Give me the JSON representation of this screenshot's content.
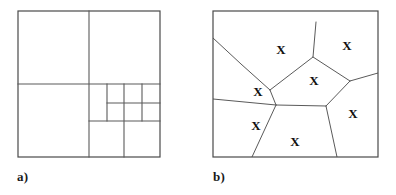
{
  "figure": {
    "background_color": "#ffffff",
    "line_color": "#5a5a5a",
    "border_color": "#4a4a4a",
    "marker_color": "#111111",
    "width": 396,
    "height": 195
  },
  "panels": [
    {
      "id": "a",
      "caption": "a)",
      "type": "quadtree",
      "frame": {
        "x": 18,
        "y": 11,
        "w": 142,
        "h": 146
      },
      "description": "Adaptive quadtree subdivision of a square region",
      "split_lines": [
        {
          "name": "root-vertical-split",
          "x1": 89,
          "y1": 11,
          "x2": 89,
          "y2": 157
        },
        {
          "name": "root-horizontal-split",
          "x1": 18,
          "y1": 84,
          "x2": 160,
          "y2": 84
        },
        {
          "name": "q-br-vertical-split",
          "x1": 124,
          "y1": 84,
          "x2": 124,
          "y2": 157
        },
        {
          "name": "q-br-horizontal-split",
          "x1": 89,
          "y1": 121,
          "x2": 160,
          "y2": 121
        },
        {
          "name": "q-br-tl-vertical-split",
          "x1": 107,
          "y1": 84,
          "x2": 107,
          "y2": 121
        },
        {
          "name": "q-br-tl-horizontal-split",
          "x1": 107,
          "y1": 103,
          "x2": 160,
          "y2": 103
        },
        {
          "name": "q-br-tl-tr-vertical-split",
          "x1": 142,
          "y1": 84,
          "x2": 142,
          "y2": 121
        }
      ]
    },
    {
      "id": "b",
      "caption": "b)",
      "type": "voronoi",
      "frame": {
        "x": 15,
        "y": 11,
        "w": 165,
        "h": 146
      },
      "description": "Voronoi tessellation with seven generator sites marked X",
      "marker_glyph": "X",
      "site_count": 7,
      "sites": [
        {
          "name": "site-top-left",
          "x": 68,
          "y": 38
        },
        {
          "name": "site-top-right",
          "x": 134,
          "y": 34
        },
        {
          "name": "site-center",
          "x": 101,
          "y": 69
        },
        {
          "name": "site-left",
          "x": 45,
          "y": 80
        },
        {
          "name": "site-right",
          "x": 140,
          "y": 102
        },
        {
          "name": "site-bottom-left",
          "x": 43,
          "y": 114
        },
        {
          "name": "site-bottom",
          "x": 82,
          "y": 130
        }
      ],
      "edges": [
        {
          "name": "edge-topleft-to-left-border",
          "points": "0,27 28,53 57,79"
        },
        {
          "name": "edge-left-to-center-junction",
          "points": "57,79 63,94"
        },
        {
          "name": "edge-topleft-topright",
          "points": "57,79 100,46 103,11"
        },
        {
          "name": "edge-center-top-right",
          "points": "100,46 137,70"
        },
        {
          "name": "edge-right-border",
          "points": "137,70 165,62"
        },
        {
          "name": "edge-center-right",
          "points": "137,70 113,95"
        },
        {
          "name": "edge-center-bottom",
          "points": "113,95 63,94"
        },
        {
          "name": "edge-left-horizontal",
          "points": "0,88 63,94"
        },
        {
          "name": "edge-bottom-left-split",
          "points": "63,94 39,146"
        },
        {
          "name": "edge-bottom-right-split",
          "points": "113,95 124,146"
        }
      ]
    }
  ]
}
